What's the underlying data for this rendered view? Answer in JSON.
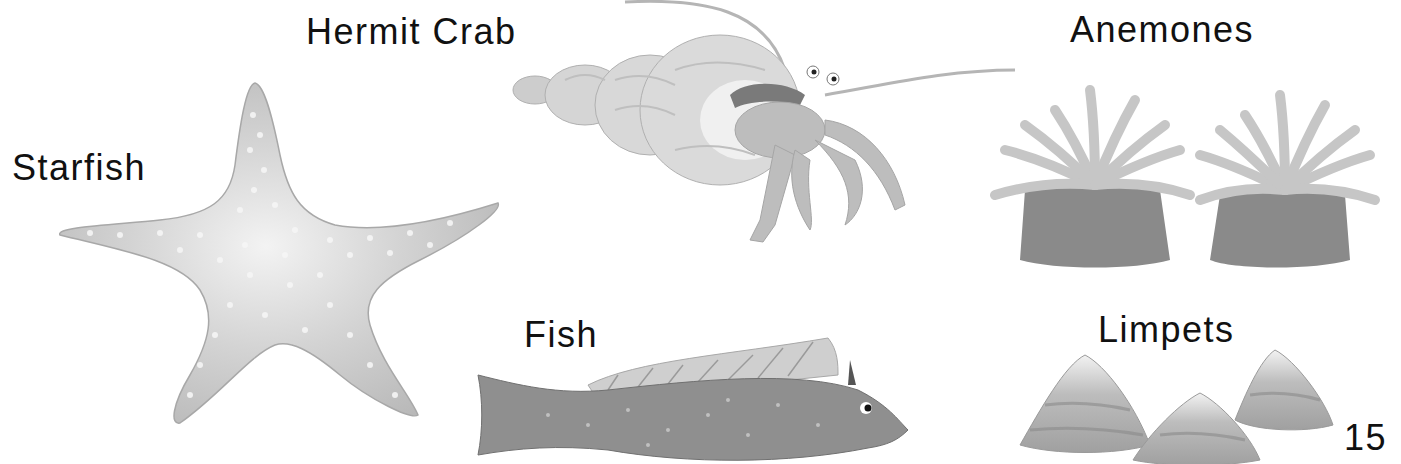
{
  "page": {
    "page_number": "15",
    "labels": {
      "starfish": "Starfish",
      "hermit_crab": "Hermit Crab",
      "anemones": "Anemones",
      "fish": "Fish",
      "limpets": "Limpets"
    },
    "illustrations": [
      {
        "name": "starfish",
        "style": "grayscale watercolor"
      },
      {
        "name": "hermit-crab",
        "style": "grayscale watercolor"
      },
      {
        "name": "anemones",
        "count": 2
      },
      {
        "name": "fish",
        "style": "grayscale watercolor"
      },
      {
        "name": "limpets",
        "count": 3
      }
    ],
    "colors": {
      "text": "#111111",
      "background": "#ffffff"
    }
  }
}
